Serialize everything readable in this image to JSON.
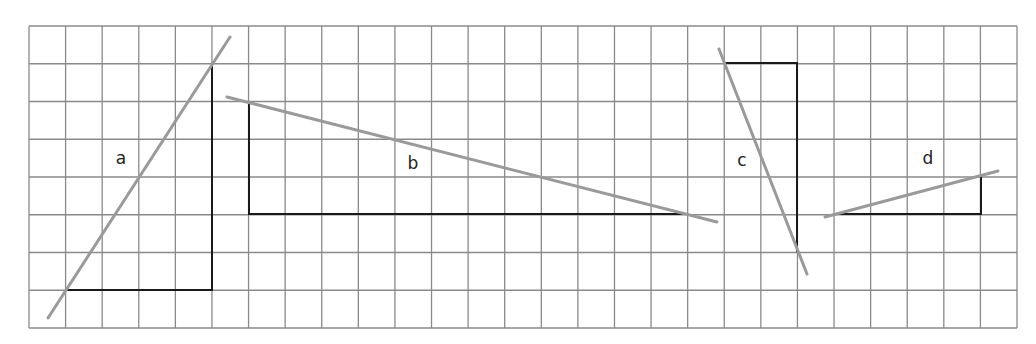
{
  "grid": {
    "left": 29,
    "top": 26,
    "right": 1017,
    "bottom": 328,
    "columns": 27,
    "rows": 8,
    "line_color": "#8a8a8a"
  },
  "colors": {
    "triangle_leg": "#1a1a1a",
    "hypotenuse": "#9a9a9a",
    "label": "#222222"
  },
  "triangles": [
    {
      "id": "a",
      "label": "a",
      "label_pos": [
        121,
        158
      ],
      "legs": [
        [
          67,
          290
        ],
        [
          212,
          290
        ],
        [
          212,
          64
        ]
      ],
      "hypotenuse": [
        [
          48,
          318
        ],
        [
          230,
          37
        ]
      ]
    },
    {
      "id": "b",
      "label": "b",
      "label_pos": [
        413,
        163
      ],
      "legs": [
        [
          249,
          101
        ],
        [
          249,
          214
        ],
        [
          688,
          214
        ]
      ],
      "hypotenuse": [
        [
          227,
          97
        ],
        [
          717,
          222
        ]
      ]
    },
    {
      "id": "c",
      "label": "c",
      "label_pos": [
        742,
        160
      ],
      "legs": [
        [
          725,
          63
        ],
        [
          797,
          63
        ],
        [
          797,
          252
        ]
      ],
      "hypotenuse": [
        [
          719,
          49
        ],
        [
          807,
          274
        ]
      ]
    },
    {
      "id": "d",
      "label": "d",
      "label_pos": [
        928,
        158
      ],
      "legs": [
        [
          835,
          214
        ],
        [
          981,
          214
        ],
        [
          981,
          176
        ]
      ],
      "hypotenuse": [
        [
          825,
          217
        ],
        [
          998,
          171
        ]
      ]
    }
  ]
}
